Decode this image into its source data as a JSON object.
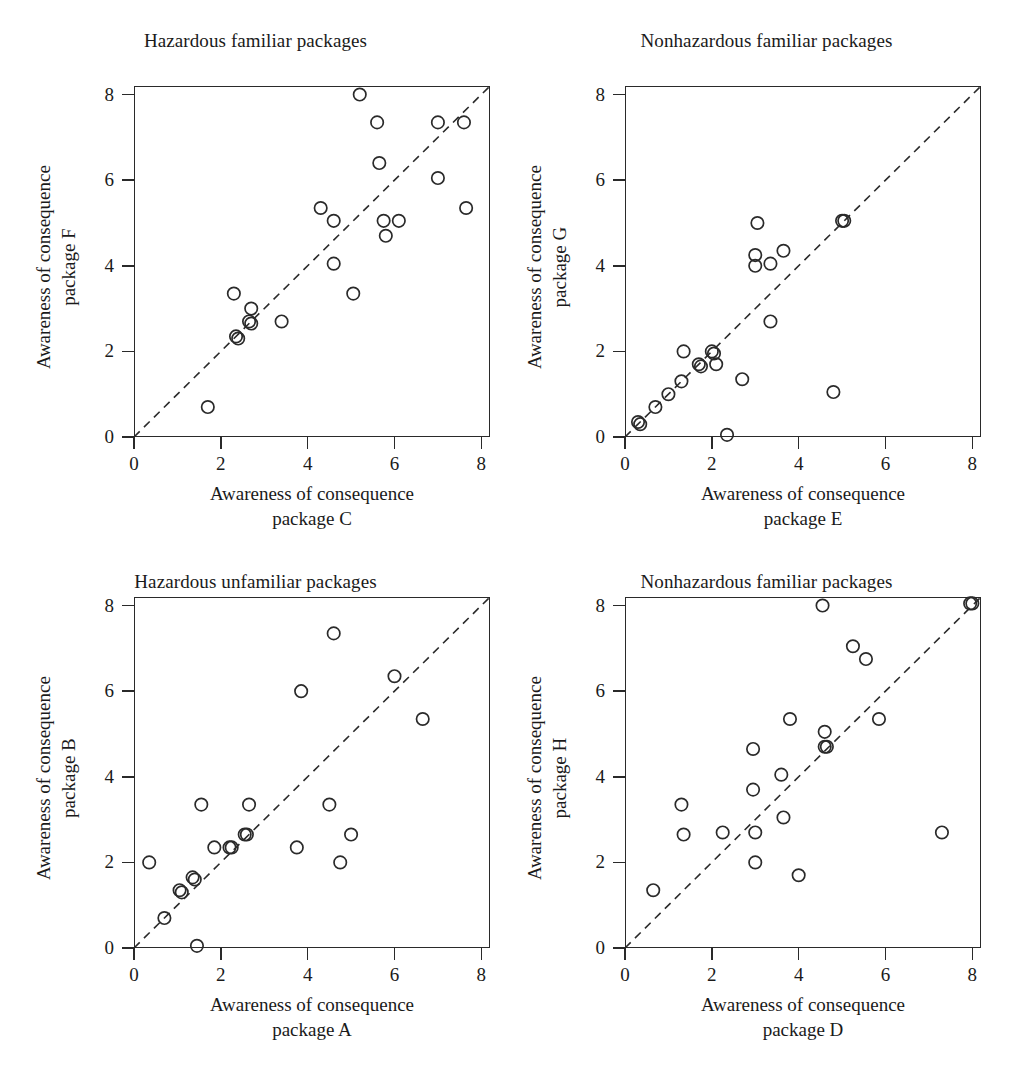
{
  "figure": {
    "axis_label_prefix": "Awareness of consequence",
    "tick_values": [
      0,
      2,
      4,
      6,
      8
    ]
  },
  "chart_data": [
    {
      "type": "scatter",
      "title": "Hazardous familiar packages",
      "xlabel": "Awareness of consequence package C",
      "xlabel_line1": "Awareness of consequence",
      "xlabel_line2": "package C",
      "ylabel": "Awareness of consequence package F",
      "ylabel_line1": "Awareness of consequence",
      "ylabel_line2": "package F",
      "xlim": [
        0,
        8.2
      ],
      "ylim": [
        0,
        8.2
      ],
      "xticks": [
        0,
        2,
        4,
        6,
        8
      ],
      "yticks": [
        0,
        2,
        4,
        6,
        8
      ],
      "grid": false,
      "reference_line": {
        "type": "identity",
        "style": "dashed",
        "from": [
          0,
          0
        ],
        "to": [
          8.2,
          8.2
        ]
      },
      "points": [
        [
          1.7,
          0.7
        ],
        [
          2.3,
          3.35
        ],
        [
          2.35,
          2.35
        ],
        [
          2.4,
          2.3
        ],
        [
          2.7,
          3.0
        ],
        [
          2.65,
          2.7
        ],
        [
          2.7,
          2.65
        ],
        [
          3.4,
          2.7
        ],
        [
          4.3,
          5.35
        ],
        [
          4.6,
          5.05
        ],
        [
          4.6,
          4.05
        ],
        [
          5.05,
          3.35
        ],
        [
          5.2,
          8.0
        ],
        [
          5.6,
          7.35
        ],
        [
          5.65,
          6.4
        ],
        [
          5.75,
          5.05
        ],
        [
          5.8,
          4.7
        ],
        [
          6.1,
          5.05
        ],
        [
          7.0,
          7.35
        ],
        [
          7.0,
          6.05
        ],
        [
          7.6,
          7.35
        ],
        [
          7.65,
          5.35
        ]
      ]
    },
    {
      "type": "scatter",
      "title": "Nonhazardous familiar packages",
      "xlabel": "Awareness of consequence package E",
      "xlabel_line1": "Awareness of consequence",
      "xlabel_line2": "package E",
      "ylabel": "Awareness of consequence package G",
      "ylabel_line1": "Awareness of consequence",
      "ylabel_line2": "package G",
      "xlim": [
        0,
        8.2
      ],
      "ylim": [
        0,
        8.2
      ],
      "xticks": [
        0,
        2,
        4,
        6,
        8
      ],
      "yticks": [
        0,
        2,
        4,
        6,
        8
      ],
      "grid": false,
      "reference_line": {
        "type": "identity",
        "style": "dashed",
        "from": [
          0,
          0
        ],
        "to": [
          8.2,
          8.2
        ]
      },
      "points": [
        [
          0.3,
          0.35
        ],
        [
          0.35,
          0.3
        ],
        [
          0.7,
          0.7
        ],
        [
          1.0,
          1.0
        ],
        [
          1.3,
          1.3
        ],
        [
          1.35,
          2.0
        ],
        [
          1.7,
          1.7
        ],
        [
          1.75,
          1.65
        ],
        [
          2.0,
          2.0
        ],
        [
          2.05,
          1.95
        ],
        [
          2.1,
          1.7
        ],
        [
          2.35,
          0.05
        ],
        [
          2.7,
          1.35
        ],
        [
          3.0,
          4.25
        ],
        [
          3.0,
          4.0
        ],
        [
          3.05,
          5.0
        ],
        [
          3.35,
          4.05
        ],
        [
          3.35,
          2.7
        ],
        [
          3.65,
          4.35
        ],
        [
          4.8,
          1.05
        ],
        [
          5.0,
          5.05
        ],
        [
          5.05,
          5.05
        ]
      ]
    },
    {
      "type": "scatter",
      "title": "Hazardous unfamiliar packages",
      "xlabel": "Awareness of consequence package A",
      "xlabel_line1": "Awareness of consequence",
      "xlabel_line2": "package A",
      "ylabel": "Awareness of consequence package B",
      "ylabel_line1": "Awareness of consequence",
      "ylabel_line2": "package B",
      "xlim": [
        0,
        8.2
      ],
      "ylim": [
        0,
        8.2
      ],
      "xticks": [
        0,
        2,
        4,
        6,
        8
      ],
      "yticks": [
        0,
        2,
        4,
        6,
        8
      ],
      "grid": false,
      "reference_line": {
        "type": "identity",
        "style": "dashed",
        "from": [
          0,
          0
        ],
        "to": [
          8.2,
          8.2
        ]
      },
      "points": [
        [
          0.35,
          2.0
        ],
        [
          0.7,
          0.7
        ],
        [
          1.05,
          1.35
        ],
        [
          1.1,
          1.3
        ],
        [
          1.35,
          1.65
        ],
        [
          1.4,
          1.6
        ],
        [
          1.45,
          0.05
        ],
        [
          1.55,
          3.35
        ],
        [
          1.85,
          2.35
        ],
        [
          2.2,
          2.35
        ],
        [
          2.25,
          2.35
        ],
        [
          2.55,
          2.65
        ],
        [
          2.6,
          2.65
        ],
        [
          2.65,
          3.35
        ],
        [
          3.75,
          2.35
        ],
        [
          3.85,
          6.0
        ],
        [
          4.5,
          3.35
        ],
        [
          4.6,
          7.35
        ],
        [
          4.75,
          2.0
        ],
        [
          5.0,
          2.65
        ],
        [
          6.0,
          6.35
        ],
        [
          6.65,
          5.35
        ]
      ]
    },
    {
      "type": "scatter",
      "title": "Nonhazardous familiar packages",
      "xlabel": "Awareness of consequence package D",
      "xlabel_line1": "Awareness of consequence",
      "xlabel_line2": "package D",
      "ylabel": "Awareness of consequence package H",
      "ylabel_line1": "Awareness of consequence",
      "ylabel_line2": "package H",
      "xlim": [
        0,
        8.2
      ],
      "ylim": [
        0,
        8.2
      ],
      "xticks": [
        0,
        2,
        4,
        6,
        8
      ],
      "yticks": [
        0,
        2,
        4,
        6,
        8
      ],
      "grid": false,
      "reference_line": {
        "type": "identity",
        "style": "dashed",
        "from": [
          0,
          0
        ],
        "to": [
          8.2,
          8.2
        ]
      },
      "points": [
        [
          0.65,
          1.35
        ],
        [
          1.3,
          3.35
        ],
        [
          1.35,
          2.65
        ],
        [
          2.25,
          2.7
        ],
        [
          2.95,
          4.65
        ],
        [
          2.95,
          3.7
        ],
        [
          3.0,
          2.7
        ],
        [
          3.0,
          2.0
        ],
        [
          3.6,
          4.05
        ],
        [
          3.65,
          3.05
        ],
        [
          3.8,
          5.35
        ],
        [
          4.0,
          1.7
        ],
        [
          4.55,
          8.0
        ],
        [
          4.6,
          5.05
        ],
        [
          4.6,
          4.7
        ],
        [
          4.65,
          4.7
        ],
        [
          5.25,
          7.05
        ],
        [
          5.55,
          6.75
        ],
        [
          5.85,
          5.35
        ],
        [
          7.3,
          2.7
        ],
        [
          7.95,
          8.05
        ],
        [
          8.0,
          8.05
        ]
      ]
    }
  ]
}
